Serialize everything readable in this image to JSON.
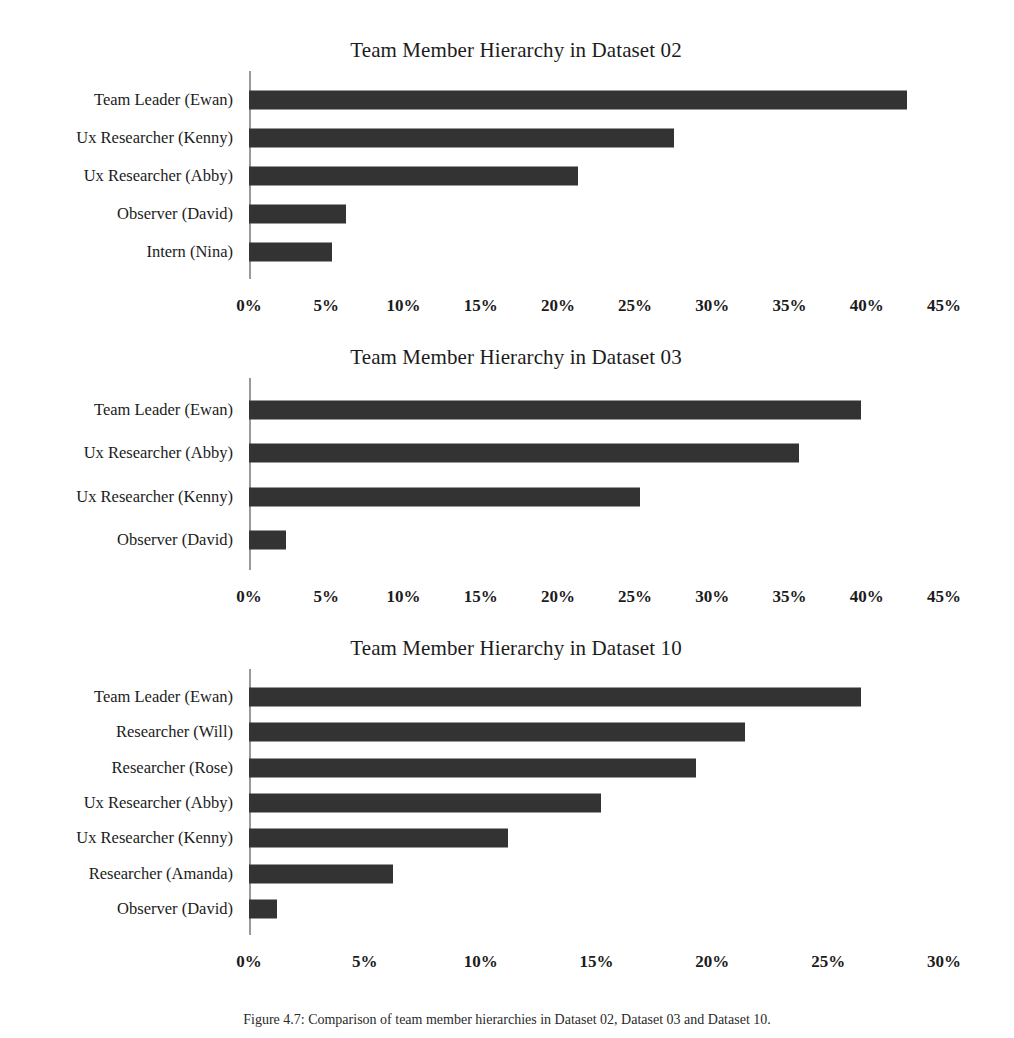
{
  "document": {
    "background_color": "#ffffff",
    "bar_color": "#333333",
    "axis_color": "#9a9a9a",
    "text_color": "#1c1c1c",
    "caption": "Figure 4.7: Comparison of team member hierarchies in Dataset 02, Dataset 03 and Dataset 10."
  },
  "chart_data": [
    {
      "type": "bar",
      "orientation": "horizontal",
      "title": "Team Member Hierarchy in Dataset 02",
      "xlabel": "",
      "ylabel": "",
      "grid": false,
      "legend": "none",
      "xlim": [
        0,
        45
      ],
      "xticks": [
        "0%",
        "5%",
        "10%",
        "15%",
        "20%",
        "25%",
        "30%",
        "35%",
        "40%",
        "45%"
      ],
      "xtick_values": [
        0,
        5,
        10,
        15,
        20,
        25,
        30,
        35,
        40,
        45
      ],
      "categories": [
        "Team Leader (Ewan)",
        "Ux Researcher (Kenny)",
        "Ux Researcher (Abby)",
        "Observer (David)",
        "Intern (Nina)"
      ],
      "values": [
        42.6,
        27.5,
        21.3,
        6.3,
        5.4
      ]
    },
    {
      "type": "bar",
      "orientation": "horizontal",
      "title": "Team Member Hierarchy in Dataset 03",
      "xlabel": "",
      "ylabel": "",
      "grid": false,
      "legend": "none",
      "xlim": [
        0,
        45
      ],
      "xticks": [
        "0%",
        "5%",
        "10%",
        "15%",
        "20%",
        "25%",
        "30%",
        "35%",
        "40%",
        "45%"
      ],
      "xtick_values": [
        0,
        5,
        10,
        15,
        20,
        25,
        30,
        35,
        40,
        45
      ],
      "categories": [
        "Team Leader (Ewan)",
        "Ux Researcher (Abby)",
        "Ux Researcher (Kenny)",
        "Observer (David)"
      ],
      "values": [
        39.6,
        35.6,
        25.3,
        2.4
      ]
    },
    {
      "type": "bar",
      "orientation": "horizontal",
      "title": "Team Member Hierarchy in Dataset 10",
      "xlabel": "",
      "ylabel": "",
      "grid": false,
      "legend": "none",
      "xlim": [
        0,
        30
      ],
      "xticks": [
        "0%",
        "5%",
        "10%",
        "15%",
        "20%",
        "25%",
        "30%"
      ],
      "xtick_values": [
        0,
        5,
        10,
        15,
        20,
        25,
        30
      ],
      "categories": [
        "Team Leader (Ewan)",
        "Researcher (Will)",
        "Researcher (Rose)",
        "Ux Researcher (Abby)",
        "Ux Researcher (Kenny)",
        "Researcher (Amanda)",
        "Observer (David)"
      ],
      "values": [
        26.4,
        21.4,
        19.3,
        15.2,
        11.2,
        6.2,
        1.2
      ]
    }
  ]
}
